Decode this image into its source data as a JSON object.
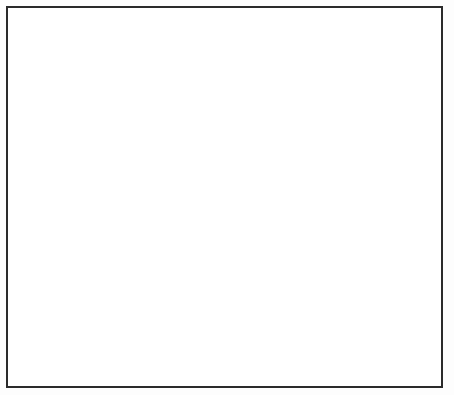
{
  "chart_data": {
    "type": "line",
    "title": "",
    "subtitle": "",
    "ylabel": "Million tonnes p.a.",
    "xlabel": "",
    "ylim": [
      0,
      7
    ],
    "xlim": [
      1945,
      1985
    ],
    "yticks": [
      "0",
      "1",
      "2",
      "3",
      "4",
      "5",
      "6",
      "7"
    ],
    "xticks": [
      "1945",
      "1950",
      "1955",
      "1960",
      "1965",
      "1970",
      "1975",
      "1980",
      "1985"
    ],
    "x_axis_note": "Plan",
    "grid": "horizontal-dashed",
    "legend": "inline-labels",
    "shaded_band": {
      "between": [
        "West Siberia",
        "Volga-Urals"
      ],
      "color": "#eeeeee",
      "start_year": 1967
    },
    "series": [
      {
        "name": "West Siberia",
        "label": "West Siberia",
        "style": "thick-solid-then-dashed",
        "dash_from": 1980,
        "x": [
          1945,
          1950,
          1955,
          1960,
          1963,
          1965,
          1967,
          1969,
          1971,
          1973,
          1975,
          1977,
          1979,
          1980,
          1982,
          1985
        ],
        "y": [
          0.15,
          0.2,
          0.35,
          0.75,
          1.35,
          1.95,
          2.95,
          3.8,
          4.55,
          5.25,
          5.7,
          5.95,
          6.05,
          6.1,
          6.2,
          6.3
        ]
      },
      {
        "name": "Volga-Urals",
        "label": "Volga-Urals",
        "style": "thick-solid-then-dashed",
        "dash_from": 1980,
        "x": [
          1945,
          1950,
          1955,
          1960,
          1965,
          1968,
          1970,
          1972,
          1974,
          1976,
          1978,
          1980,
          1982,
          1985
        ],
        "y": [
          0.2,
          0.42,
          0.68,
          1.45,
          2.5,
          2.95,
          3.1,
          3.3,
          3.45,
          3.4,
          3.15,
          2.85,
          2.6,
          2.2
        ]
      },
      {
        "name": "(Samotlor)",
        "label": "(Samotlor)",
        "style": "thin-solid-then-dashed",
        "dash_from": 1979,
        "x": [
          1968,
          1970,
          1972,
          1974,
          1975,
          1977,
          1979,
          1981,
          1983,
          1985
        ],
        "y": [
          1.55,
          2.6,
          3.6,
          4.2,
          4.3,
          4.25,
          4.1,
          3.95,
          3.8,
          3.7
        ]
      },
      {
        "name": "(Romashkino)",
        "label": "(Romashkino)",
        "style": "thin-solid",
        "x": [
          1956,
          1960,
          1964,
          1967,
          1970,
          1972,
          1974,
          1976,
          1978,
          1979
        ],
        "y": [
          0.42,
          0.72,
          1.05,
          1.3,
          1.55,
          1.65,
          1.62,
          1.5,
          1.33,
          1.25
        ]
      },
      {
        "name": "Azerbaidjan/North Caucasus",
        "label": "Azerbaidjan/North Caucasus",
        "style": "medium-solid",
        "x": [
          1945,
          1950,
          1955,
          1960,
          1964,
          1967,
          1970,
          1972,
          1974,
          1976,
          1978,
          1980
        ],
        "y": [
          0.2,
          0.25,
          0.3,
          0.42,
          0.6,
          0.72,
          0.85,
          0.92,
          0.95,
          0.95,
          0.9,
          0.82
        ]
      },
      {
        "name": "Rest",
        "label": "Rest",
        "style": "medium-solid",
        "x": [
          1945,
          1950,
          1955,
          1960,
          1964,
          1967,
          1970,
          1972,
          1974,
          1976,
          1978,
          1980
        ],
        "y": [
          0.05,
          0.06,
          0.08,
          0.14,
          0.22,
          0.3,
          0.4,
          0.48,
          0.54,
          0.57,
          0.56,
          0.52
        ]
      }
    ],
    "annotations": [
      {
        "text": "West Siberia",
        "x": 1972,
        "y": 4.75
      },
      {
        "text": "(Samotlor)",
        "x": 1973,
        "y": 3.55
      },
      {
        "text": "Volga-Urals",
        "x": 1969,
        "y": 2.45
      },
      {
        "text": "(Romashkino)",
        "x": 1970,
        "y": 1.38
      },
      {
        "text": "Azerbaidjan/North Caucasus",
        "x": 1971,
        "y": 0.8
      },
      {
        "text": "Rest",
        "x": 1970,
        "y": 0.3
      }
    ]
  },
  "colors": {
    "frame": "#2b2b2b",
    "grid": "#9a9a9a",
    "axis": "#6a6a6a",
    "series_dark": "#000000",
    "series_thin": "#2a2a2a",
    "band_fill": "#ededed",
    "text": "#1f1f1f",
    "background": "#ffffff"
  }
}
